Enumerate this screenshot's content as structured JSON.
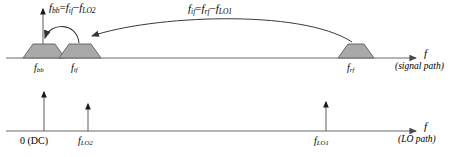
{
  "figure": {
    "type": "spectrum-diagram",
    "title": "",
    "background": "#ffffff",
    "stroke_color": "#4a4a4a",
    "text_color": "#000000",
    "trapezoid_fill": "#a8a8a8",
    "trapezoid_stroke": "#5a5a5a"
  },
  "annotations": {
    "equation_bb": "f_bb = f_if − f_LO2",
    "equation_bb_parts": {
      "lhs_base": "f",
      "lhs_sub": "bb",
      "eq": "=",
      "t1_base": "f",
      "t1_sub": "if",
      "minus": "−",
      "t2_base": "f",
      "t2_sub": "LO2"
    },
    "equation_if": "f_if = f_rf − f_LO1",
    "equation_if_parts": {
      "lhs_base": "f",
      "lhs_sub": "if",
      "eq": "=",
      "t1_base": "f",
      "t1_sub": "rf",
      "minus": "−",
      "t2_base": "f",
      "t2_sub": "LO1"
    }
  },
  "signal_path": {
    "axis_label": "f",
    "path_label": "(signal path)",
    "ticks": [
      {
        "id": "f-bb",
        "base": "f",
        "sub": "bb",
        "x": 44
      },
      {
        "id": "f-if",
        "base": "f",
        "sub": "if",
        "x": 80
      },
      {
        "id": "f-rf",
        "base": "f",
        "sub": "rf",
        "x": 356
      }
    ],
    "bands": [
      {
        "id": "band-bb",
        "center": 44,
        "half_bottom": 21,
        "half_top": 11,
        "height": 14
      },
      {
        "id": "band-if",
        "center": 80,
        "half_bottom": 21,
        "half_top": 11,
        "height": 14
      },
      {
        "id": "band-rf",
        "center": 356,
        "half_bottom": 18,
        "half_top": 10,
        "height": 14
      }
    ]
  },
  "lo_path": {
    "axis_label": "f",
    "path_label": "(LO path)",
    "ticks": [
      {
        "id": "dc",
        "text": "0 (DC)",
        "x": 45,
        "height": 40
      },
      {
        "id": "f-lo2",
        "base": "f",
        "sub": "LO2",
        "x": 89,
        "height": 28
      },
      {
        "id": "f-lo1",
        "base": "f",
        "sub": "LO1",
        "x": 327,
        "height": 30
      }
    ]
  },
  "arrows": {
    "mix_if_to_bb": "arc-arrow-if-to-bb",
    "mix_rf_to_if": "long-arrow-rf-to-if",
    "vertical_axis": "vertical-axis-arrow"
  }
}
